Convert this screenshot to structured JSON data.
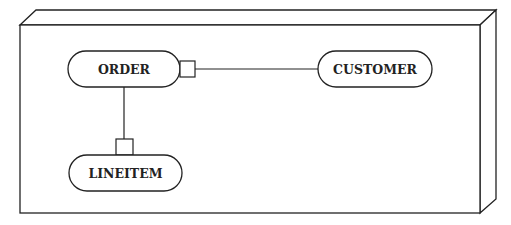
{
  "diagram": {
    "type": "deployment-node-with-components",
    "node": {
      "shape": "3d-box",
      "label": ""
    },
    "components": [
      {
        "id": "order",
        "label": "ORDER"
      },
      {
        "id": "customer",
        "label": "CUSTOMER"
      },
      {
        "id": "lineitem",
        "label": "LINEITEM"
      }
    ],
    "connections": [
      {
        "from": "order",
        "to": "customer",
        "port_on": "order",
        "port_side": "right"
      },
      {
        "from": "order",
        "to": "lineitem",
        "port_on": "lineitem",
        "port_side": "top"
      }
    ],
    "colors": {
      "stroke": "#222222",
      "background": "#ffffff"
    }
  }
}
